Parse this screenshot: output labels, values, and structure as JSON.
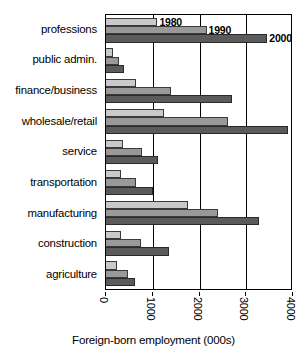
{
  "chart_data": {
    "type": "bar",
    "orientation": "horizontal",
    "title": "",
    "xlabel": "Foreign-born employment (000s)",
    "ylabel": "",
    "xlim": [
      0,
      4000
    ],
    "xticks": [
      0,
      1000,
      2000,
      3000,
      4000
    ],
    "xtick_labels": [
      "0",
      "1000",
      "2000",
      "3000",
      "4000"
    ],
    "grid": true,
    "grid_axis": "x",
    "legend_position": "inline-at-bar-ends",
    "categories": [
      "professions",
      "public admin.",
      "finance/business",
      "wholesale/retail",
      "service",
      "transportation",
      "manufacturing",
      "construction",
      "agriculture"
    ],
    "series": [
      {
        "name": "1980",
        "color": "#c9c9c9",
        "values": [
          1100,
          140,
          650,
          1250,
          360,
          320,
          1750,
          330,
          230
        ]
      },
      {
        "name": "1990",
        "color": "#999999",
        "values": [
          2150,
          280,
          1400,
          2620,
          760,
          650,
          2400,
          740,
          460
        ]
      },
      {
        "name": "2000",
        "color": "#5b5b5b",
        "values": [
          3450,
          380,
          2700,
          3900,
          1120,
          1010,
          3270,
          1350,
          630
        ]
      }
    ],
    "annotations": [
      {
        "text": "1980",
        "series": "1980",
        "category": "professions"
      },
      {
        "text": "1990",
        "series": "1990",
        "category": "professions"
      },
      {
        "text": "2000",
        "series": "2000",
        "category": "professions"
      }
    ]
  }
}
